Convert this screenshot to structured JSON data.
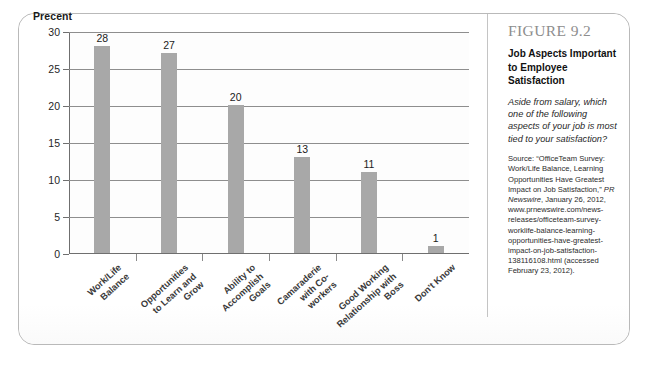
{
  "figure": {
    "number": "FIGURE 9.2",
    "title": "Job Aspects Important to Employee Satisfaction",
    "question": "Aside from salary, which one of the following aspects of your job is most tied to your satisfaction?",
    "source_prefix": "Source: “OfficeTeam Survey: Work/Life Balance, Learning Opportunities Have Greatest Impact on Job Satisfaction,” ",
    "source_italic": "PR Newswire",
    "source_suffix": ", January 26, 2012, www.prnewswire.com/news-releases/officeteam-survey-worklife-balance-learning-opportunities-have-greatest-impact-on-job-satisfaction-138116108.html (accessed February 23, 2012)."
  },
  "chart_data": {
    "type": "bar",
    "title": "Job Aspects Important to Employee Satisfaction",
    "xlabel": "",
    "ylabel": "Precent",
    "ylim": [
      0,
      30
    ],
    "yticks": [
      0,
      5,
      10,
      15,
      20,
      25,
      30
    ],
    "ytick_labels": [
      "0",
      "5",
      "10",
      "15",
      "20",
      "25",
      "30"
    ],
    "gridlines": [
      5,
      10,
      15,
      20,
      25,
      30
    ],
    "grid": true,
    "legend": "none",
    "bar_color": "#a8a8a8",
    "categories": [
      "Work/Life Balance",
      "Opportunities to Learn and Grow",
      "Ability to Accomplish Goals",
      "Camaraderie with Co-workers",
      "Good Working Relationship with Boss",
      "Don't Know"
    ],
    "category_lines": [
      [
        "Work/Life",
        "Balance"
      ],
      [
        "Opportunities",
        "to Learn and",
        "Grow"
      ],
      [
        "Ability to",
        "Accomplish",
        "Goals"
      ],
      [
        "Camaraderie",
        "with Co-",
        "workers"
      ],
      [
        "Good Working",
        "Relationship with",
        "Boss"
      ],
      [
        "Don't Know"
      ]
    ],
    "values": [
      28,
      27,
      20,
      13,
      11,
      1
    ],
    "value_labels": [
      "28",
      "27",
      "20",
      "13",
      "11",
      "1"
    ]
  }
}
